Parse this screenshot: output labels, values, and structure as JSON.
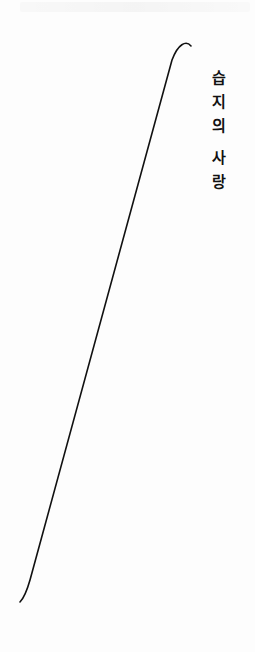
{
  "page": {
    "background": "#fdfdfd",
    "ink_color": "#111111"
  },
  "title": {
    "text": "습지의 사랑",
    "chars": [
      "습",
      "지",
      "의",
      "사",
      "랑"
    ],
    "orientation": "vertical"
  },
  "decoration": {
    "type": "diagonal-curved-stroke",
    "start": [
      191,
      44
    ],
    "end": [
      21,
      602
    ]
  }
}
